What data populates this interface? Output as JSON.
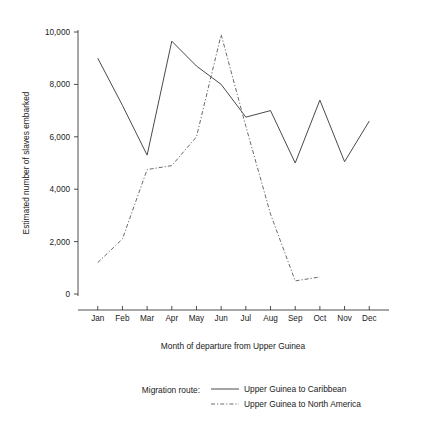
{
  "chart_data": {
    "type": "line",
    "title": "",
    "xlabel": "Month of departure from Upper Guinea",
    "ylabel": "Estimated number of slaves embarked",
    "categories": [
      "Jan",
      "Feb",
      "Mar",
      "Apr",
      "May",
      "Jun",
      "Jul",
      "Aug",
      "Sep",
      "Oct",
      "Nov",
      "Dec"
    ],
    "ylim": [
      0,
      10000
    ],
    "yticks": [
      0,
      2000,
      4000,
      6000,
      8000,
      10000
    ],
    "ytick_labels": [
      "0",
      "2,000",
      "4,000",
      "6,000",
      "8,000",
      "10,000"
    ],
    "grid": false,
    "legend_position": "bottom",
    "series": [
      {
        "name": "Upper Guinea to Caribbean",
        "style": "solid",
        "color": "#4a4a4a",
        "values": [
          9000,
          7200,
          5300,
          9650,
          8700,
          8000,
          6750,
          7000,
          5000,
          7400,
          5050,
          6600
        ]
      },
      {
        "name": "Upper Guinea to North America",
        "style": "dashed",
        "color": "#6a6a6a",
        "values": [
          1200,
          2100,
          4750,
          4900,
          6000,
          9900,
          6400,
          3050,
          500,
          650,
          null,
          null
        ]
      }
    ]
  },
  "legend": {
    "title": "Migration route:",
    "entries": [
      {
        "label": "Upper Guinea to Caribbean",
        "style": "solid"
      },
      {
        "label": "Upper Guinea to North America",
        "style": "dashed"
      }
    ]
  },
  "axes": {
    "y_title": "Estimated number of slaves embarked",
    "x_title": "Month of departure from Upper Guinea"
  }
}
